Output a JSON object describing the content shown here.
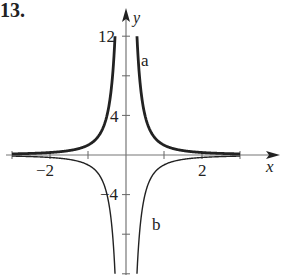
{
  "problem_number": "13.",
  "chart_data": {
    "type": "line",
    "title": "",
    "xlabel": "x",
    "ylabel": "y",
    "xlim": [
      -3.2,
      3.9
    ],
    "ylim": [
      -12,
      14
    ],
    "x_ticks": [
      -3,
      -2,
      -1,
      1,
      2,
      3
    ],
    "x_tick_labels": {
      "-2": "−2",
      "2": "2"
    },
    "y_ticks": [
      -12,
      -8,
      -4,
      4,
      8,
      12
    ],
    "y_tick_labels": {
      "12": "12",
      "4": "4",
      "-4": "−4"
    },
    "series": [
      {
        "name": "a",
        "function": "y = 1/x^2",
        "style": "thick",
        "x_range": [
          -3,
          3
        ]
      },
      {
        "name": "b",
        "function": "y = -1/x^2",
        "style": "thin",
        "x_range": [
          -3,
          3
        ]
      }
    ],
    "grid": false,
    "legend": "curve labels a and b placed beside branches"
  },
  "labels": {
    "y_axis": "y",
    "x_axis": "x",
    "tick_12": "12",
    "tick_4": "4",
    "tick_neg4": "−4",
    "tick_neg2": "−2",
    "tick_2": "2",
    "curve_a": "a",
    "curve_b": "b"
  }
}
